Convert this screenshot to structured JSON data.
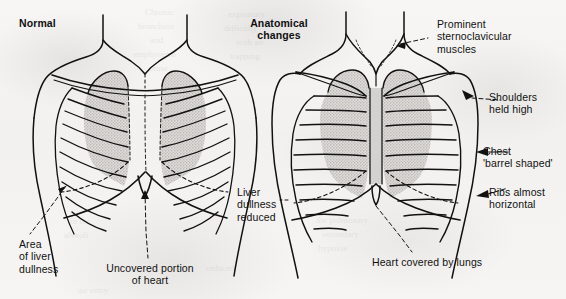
{
  "figure": {
    "title_normal": "Normal",
    "title_changes": "Anatomical\nchanges",
    "background_color": "#f4f3f1",
    "ink_color": "#111111",
    "lung_fill_color": "#c9c7c4"
  },
  "labels": {
    "normal_panel": {
      "heading": "Normal",
      "area_of_liver_dullness": "Area\nof liver\ndullness",
      "uncovered_portion_of_heart": "Uncovered portion\nof heart"
    },
    "changes_panel": {
      "heading": "Anatomical\nchanges",
      "prominent_sternoclavicular_muscles": "Prominent\nsternoclavicular\nmuscles",
      "shoulders_held_high": "Shoulders\nheld high",
      "chest_barrel_shaped": "Chest\n'barrel shaped'",
      "ribs_almost_horizontal": "Ribs almost\nhorizontal",
      "liver_dullness_reduced": "Liver\ndullness\nreduced",
      "heart_covered_by_lungs": "Heart covered by lungs"
    }
  },
  "bleed_through_text": [
    "Chronic",
    "bronchitis",
    "and",
    "emphysema",
    "cause",
    "expiratory",
    "difficulty",
    "with air",
    "trapping",
    "in the",
    "alveoli",
    "air entry",
    "reduced",
    "the pulmonary",
    "secondary",
    "hypoxia"
  ]
}
